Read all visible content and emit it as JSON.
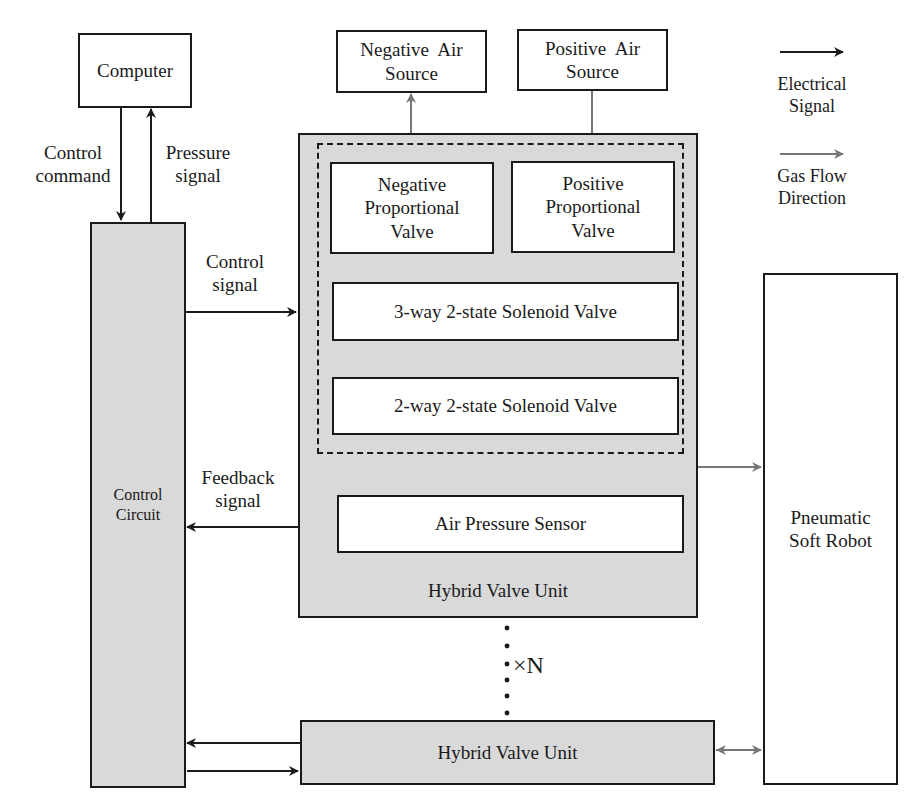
{
  "diagram": {
    "computer": {
      "label": "Computer"
    },
    "control_circuit": {
      "label_line1": "Control",
      "label_line2": "Circuit"
    },
    "negative_air_source": {
      "line1": "Negative  Air",
      "line2": "Source"
    },
    "positive_air_source": {
      "line1": "Positive  Air",
      "line2": "Source"
    },
    "hybrid_valve_unit_main": {
      "label": "Hybrid Valve Unit",
      "negative_proportional_valve": {
        "line1": "Negative",
        "line2": "Proportional",
        "line3": "Valve"
      },
      "positive_proportional_valve": {
        "line1": "Positive",
        "line2": "Proportional",
        "line3": "Valve"
      },
      "three_way_valve": {
        "label": "3-way 2-state Solenoid Valve"
      },
      "two_way_valve": {
        "label": "2-way 2-state Solenoid Valve"
      },
      "air_pressure_sensor": {
        "label": "Air Pressure Sensor"
      }
    },
    "hybrid_valve_unit_n": {
      "label": "Hybrid Valve Unit"
    },
    "multiplier": {
      "label": "×N"
    },
    "pneumatic_soft_robot": {
      "line1": "Pneumatic",
      "line2": "Soft Robot"
    },
    "signals": {
      "control_command": {
        "line1": "Control",
        "line2": "command"
      },
      "pressure_signal": {
        "line1": "Pressure",
        "line2": "signal"
      },
      "control_signal": {
        "line1": "Control",
        "line2": "signal"
      },
      "feedback_signal": {
        "line1": "Feedback",
        "line2": "signal"
      }
    },
    "legend": {
      "electrical": {
        "line1": "Electrical",
        "line2": "Signal",
        "color": "#1a1a1a"
      },
      "gas_flow": {
        "line1": "Gas Flow",
        "line2": "Direction",
        "color": "#777777"
      }
    }
  }
}
